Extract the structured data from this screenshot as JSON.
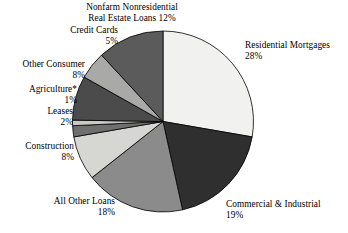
{
  "chart_data": {
    "type": "pie",
    "title": "",
    "subtitle": "",
    "xlabel": "",
    "ylabel": "",
    "legend_position": "none",
    "grid": false,
    "start_angle_deg": 0,
    "direction": "clockwise",
    "units": "percent",
    "categories": [
      "Residential Mortgages",
      "Commercial & Industrial",
      "All Other Loans",
      "Construction",
      "Leases",
      "Agriculture*",
      "Other Consumer",
      "Credit Cards",
      "Nonfarm Nonresidential Real Estate Loans"
    ],
    "values": [
      28,
      19,
      18,
      8,
      2,
      1,
      8,
      5,
      12
    ],
    "slices": [
      {
        "name": "Residential Mortgages",
        "value": 28,
        "value_text": "28%",
        "color": "#f1f1ef"
      },
      {
        "name": "Commercial & Industrial",
        "value": 19,
        "value_text": "19%",
        "color": "#2f2f2f"
      },
      {
        "name": "All Other Loans",
        "value": 18,
        "value_text": "18%",
        "color": "#8b8b8b"
      },
      {
        "name": "Construction",
        "value": 8,
        "value_text": "8%",
        "color": "#d6d6d3"
      },
      {
        "name": "Leases",
        "value": 2,
        "value_text": "2%",
        "color": "#6f6f6f"
      },
      {
        "name": "Agriculture*",
        "value": 1,
        "value_text": "1%",
        "color": "#c9c9c6"
      },
      {
        "name": "Other Consumer",
        "value": 8,
        "value_text": "8%",
        "color": "#4b4b4b"
      },
      {
        "name": "Credit Cards",
        "value": 5,
        "value_text": "5%",
        "color": "#a9a9a7"
      },
      {
        "name": "Nonfarm Nonresidential Real Estate Loans",
        "value": 12,
        "value_text": "12%",
        "color": "#5b5b5b"
      }
    ],
    "stroke_color": "#000000",
    "background": "#ffffff"
  },
  "labels": {
    "nonfarm": {
      "line1": "Nonfarm Nonresidential",
      "line2": "Real Estate Loans 12%"
    },
    "credit_cards": {
      "line1": "Credit Cards",
      "line2": "5%"
    },
    "other_consumer": {
      "line1": "Other Consumer",
      "line2": "8%"
    },
    "agriculture": {
      "line1": "Agriculture*",
      "line2": "1%"
    },
    "leases": {
      "line1": "Leases",
      "line2": "2%"
    },
    "construction": {
      "line1": "Construction",
      "line2": "8%"
    },
    "all_other_loans": {
      "line1": "All Other Loans",
      "line2": "18%"
    },
    "commercial_industrial": {
      "line1": "Commercial & Industrial",
      "line2": "19%"
    },
    "residential_mortgages": {
      "line1": "Residential Mortgages",
      "line2": "28%"
    }
  }
}
